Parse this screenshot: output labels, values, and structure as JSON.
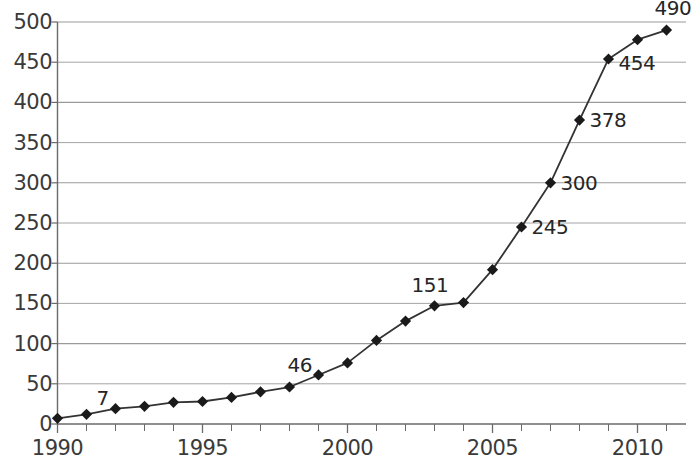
{
  "chart_data": {
    "type": "line",
    "title": "",
    "subtitle": "",
    "xlabel": "",
    "ylabel": "",
    "xlim": [
      1990,
      2012
    ],
    "ylim": [
      0,
      500
    ],
    "grid": true,
    "legend": null,
    "marker": "diamond",
    "line_color": "#333333",
    "marker_color": "#1a1a1a",
    "grid_color": "#9a9a9a",
    "axis_color": "#6a6a6a",
    "y_ticks": [
      0,
      50,
      100,
      150,
      200,
      250,
      300,
      350,
      400,
      450,
      500
    ],
    "y_tick_labels": [
      "0",
      "50",
      "100",
      "150",
      "200",
      "250",
      "300",
      "350",
      "400",
      "450",
      "500"
    ],
    "x_ticks": [
      1990,
      1995,
      2000,
      2005,
      2010
    ],
    "x_tick_labels": [
      "1990",
      "1995",
      "2000",
      "2005",
      "2010"
    ],
    "x_minor_tick_step": 1,
    "x": [
      1990,
      1991,
      1992,
      1993,
      1994,
      1995,
      1996,
      1997,
      1998,
      1999,
      2000,
      2001,
      2002,
      2003,
      2004,
      2005,
      2006,
      2007,
      2008,
      2009,
      2010,
      2011
    ],
    "values": [
      7,
      12,
      19,
      22,
      27,
      28,
      33,
      40,
      46,
      61,
      76,
      104,
      128,
      147,
      151,
      192,
      245,
      300,
      378,
      454,
      478,
      490
    ],
    "point_labels": [
      {
        "x": 1991,
        "value": 7,
        "text": "7",
        "dx": 10,
        "dy": -30
      },
      {
        "x": 1998,
        "value": 46,
        "text": "46",
        "dx": -2,
        "dy": -32
      },
      {
        "x": 2004,
        "value": 151,
        "text": "151",
        "dx": -52,
        "dy": -28
      },
      {
        "x": 2006,
        "value": 245,
        "text": "245",
        "dx": 10,
        "dy": -10
      },
      {
        "x": 2007,
        "value": 300,
        "text": "300",
        "dx": 10,
        "dy": -10
      },
      {
        "x": 2008,
        "value": 378,
        "text": "378",
        "dx": 10,
        "dy": -10
      },
      {
        "x": 2009,
        "value": 454,
        "text": "454",
        "dx": 10,
        "dy": -6
      },
      {
        "x": 2011,
        "value": 490,
        "text": "490",
        "dx": -12,
        "dy": -32
      }
    ]
  }
}
